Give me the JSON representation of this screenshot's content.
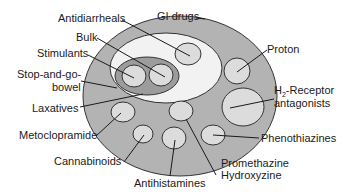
{
  "diagram": {
    "title": "GI drugs",
    "colors": {
      "outer": "#b3b3b3",
      "white_region": "#f2f2f2",
      "dark_region": "#9c9c9c",
      "small_circle": "#dcdcdc",
      "stroke": "#333333"
    },
    "labels": {
      "gi_drugs": "GI drugs",
      "antidiarrheals": "Antidiarrheals",
      "bulk": "Bulk",
      "stimulants": "Stimulants",
      "stop_and_go_line1": "Stop-and-go-",
      "stop_and_go_line2": "bowel",
      "laxatives": "Laxatives",
      "metoclopramide": "Metoclopramide",
      "cannabinoids": "Cannabinoids",
      "antihistamines": "Antihistamines",
      "promethazine": "Promethazine",
      "hydroxyzine": "Hydroxyzine",
      "phenothiazines": "Phenothiazines",
      "h2_prefix": "H",
      "h2_sub": "2",
      "h2_rest": "-Receptor",
      "h2_line2": "antagonists",
      "proton": "Proton"
    }
  }
}
